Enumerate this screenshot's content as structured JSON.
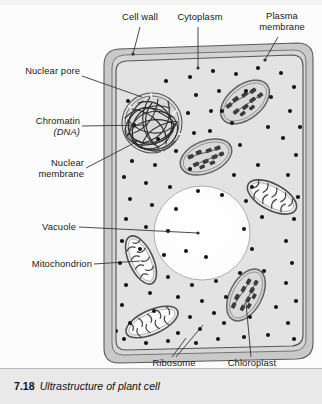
{
  "figure": {
    "number": "7.18",
    "title": "Ultrastructure of plant cell"
  },
  "labels": {
    "cell_wall": "Cell wall",
    "cytoplasm": "Cytoplasm",
    "plasma_membrane_line1": "Plasma",
    "plasma_membrane_line2": "membrane",
    "nuclear_pore": "Nuclear pore",
    "chromatin": "Chromatin",
    "chromatin_sub": "(DNA)",
    "nuclear_membrane_line1": "Nuclear",
    "nuclear_membrane_line2": "membrane",
    "vacuole": "Vacuole",
    "mitochondrion": "Mitochondrion",
    "ribosome": "Ribosome",
    "chloroplast": "Chloroplast"
  },
  "colors": {
    "cell_wall_fill": "#c9c9c9",
    "cytoplasm_fill": "#e3e3e3",
    "vacuole_fill": "#ffffff",
    "organelle_fill": "#d5d5d5",
    "organelle_stroke": "#6d6d6d",
    "ribosome": "#151515",
    "outline": "#555555",
    "leader_line": "#2b2b2b",
    "caption_band": "#e9e9e9",
    "text": "#1a1a1a"
  },
  "diagram": {
    "type": "labelled-biological-diagram",
    "structures": [
      {
        "name": "cell wall",
        "count": 1,
        "description": "thick grey outer band around whole cell"
      },
      {
        "name": "plasma membrane",
        "count": 1,
        "description": "thin line just inside the cell wall"
      },
      {
        "name": "cytoplasm",
        "count": 1,
        "description": "light grey ground substance filling the cell"
      },
      {
        "name": "nucleus",
        "count": 1,
        "description": "upper-left sphere with double nuclear membrane, nuclear pores and tangled chromatin"
      },
      {
        "name": "vacuole",
        "count": 1,
        "description": "large central white rounded space"
      },
      {
        "name": "chloroplast",
        "count": 3,
        "description": "ovals containing dark grana stacks"
      },
      {
        "name": "mitochondrion",
        "count": 3,
        "description": "ovals containing pale cristae folds"
      },
      {
        "name": "ribosome",
        "count": 120,
        "description": "small black dots scattered through the cytoplasm"
      }
    ]
  }
}
